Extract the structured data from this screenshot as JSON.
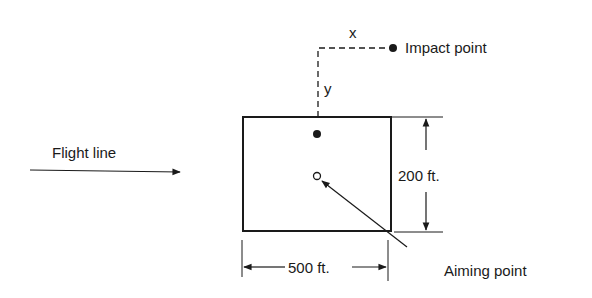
{
  "diagram": {
    "labels": {
      "x_axis": "x",
      "y_axis": "y",
      "impact_point": "Impact point",
      "flight_line": "Flight line",
      "height_dim": "200 ft.",
      "width_dim": "500 ft.",
      "aiming_point": "Aiming point"
    },
    "colors": {
      "ink": "#1a1a1a",
      "background": "#ffffff"
    }
  }
}
